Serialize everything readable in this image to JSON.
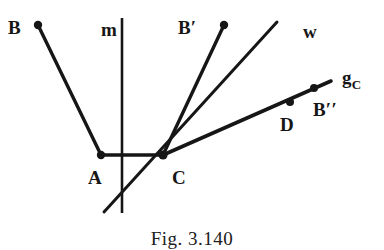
{
  "figure": {
    "caption": "Fig. 3.140",
    "background_color": "#ffffff",
    "stroke_color": "#161616",
    "labels": {
      "B": "B",
      "m": "m",
      "B_prime": "B′",
      "w": "w",
      "g_C_base": "g",
      "g_C_sub": "C",
      "D": "D",
      "B_double_prime": "B′′",
      "A": "A",
      "C": "C"
    },
    "points": {
      "B": {
        "x": 38,
        "y": 25
      },
      "A": {
        "x": 101,
        "y": 155
      },
      "C": {
        "x": 163,
        "y": 155
      },
      "B_prime": {
        "x": 224,
        "y": 25
      },
      "D": {
        "x": 290,
        "y": 102
      },
      "B_double_prime": {
        "x": 314,
        "y": 88
      }
    },
    "segments": [
      {
        "name": "B-A",
        "x1": 38,
        "y1": 25,
        "x2": 101,
        "y2": 155
      },
      {
        "name": "A-C",
        "x1": 101,
        "y1": 155,
        "x2": 163,
        "y2": 155
      },
      {
        "name": "C-B-prime",
        "x1": 163,
        "y1": 155,
        "x2": 224,
        "y2": 25
      },
      {
        "name": "line-w",
        "x1": 104,
        "y1": 212,
        "x2": 277,
        "y2": 22
      },
      {
        "name": "line-m",
        "x1": 122,
        "y1": 18,
        "x2": 122,
        "y2": 213
      },
      {
        "name": "line-g-C",
        "x1": 163,
        "y1": 155,
        "x2": 331,
        "y2": 81
      }
    ]
  }
}
